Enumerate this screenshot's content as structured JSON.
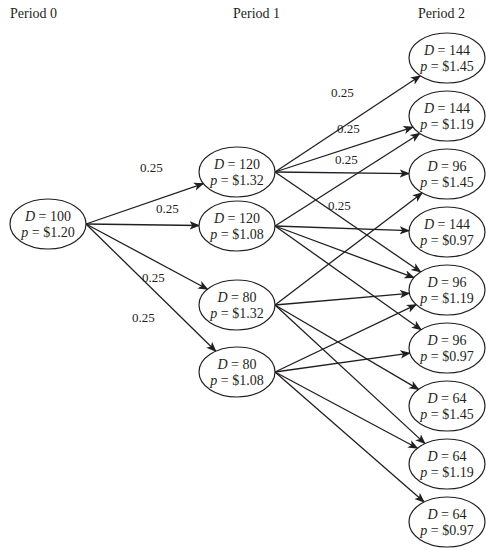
{
  "periods": [
    {
      "label": "Period 0",
      "x": 60
    },
    {
      "label": "Period 1",
      "x": 260
    },
    {
      "label": "Period 2",
      "x": 447
    }
  ],
  "colors": {
    "line": "#231f20",
    "node_fill": "#ffffff",
    "background": "#ffffff"
  },
  "node_size": {
    "rx": 38,
    "ry": 25
  },
  "nodes": [
    {
      "id": "p0",
      "period": 0,
      "D": "100",
      "p": "$1.20",
      "x": 48,
      "y": 224
    },
    {
      "id": "a",
      "period": 1,
      "D": "120",
      "p": "$1.32",
      "x": 237,
      "y": 172
    },
    {
      "id": "b",
      "period": 1,
      "D": "120",
      "p": "$1.08",
      "x": 237,
      "y": 226
    },
    {
      "id": "c",
      "period": 1,
      "D": "80",
      "p": "$1.32",
      "x": 237,
      "y": 305
    },
    {
      "id": "d",
      "period": 1,
      "D": "80",
      "p": "$1.08",
      "x": 237,
      "y": 372
    },
    {
      "id": "n1",
      "period": 2,
      "D": "144",
      "p": "$1.45",
      "x": 447,
      "y": 58
    },
    {
      "id": "n2",
      "period": 2,
      "D": "144",
      "p": "$1.19",
      "x": 447,
      "y": 116
    },
    {
      "id": "n3",
      "period": 2,
      "D": "96",
      "p": "$1.45",
      "x": 447,
      "y": 174
    },
    {
      "id": "n4",
      "period": 2,
      "D": "144",
      "p": "$0.97",
      "x": 447,
      "y": 232
    },
    {
      "id": "n5",
      "period": 2,
      "D": "96",
      "p": "$1.19",
      "x": 447,
      "y": 290
    },
    {
      "id": "n6",
      "period": 2,
      "D": "96",
      "p": "$0.97",
      "x": 447,
      "y": 348
    },
    {
      "id": "n7",
      "period": 2,
      "D": "64",
      "p": "$1.45",
      "x": 447,
      "y": 406
    },
    {
      "id": "n8",
      "period": 2,
      "D": "64",
      "p": "$1.19",
      "x": 447,
      "y": 464
    },
    {
      "id": "n9",
      "period": 2,
      "D": "64",
      "p": "$0.97",
      "x": 447,
      "y": 522
    }
  ],
  "edges": [
    {
      "from": "p0",
      "to": "a"
    },
    {
      "from": "p0",
      "to": "b"
    },
    {
      "from": "p0",
      "to": "c"
    },
    {
      "from": "p0",
      "to": "d"
    },
    {
      "from": "a",
      "to": "n1"
    },
    {
      "from": "a",
      "to": "n2"
    },
    {
      "from": "a",
      "to": "n3"
    },
    {
      "from": "a",
      "to": "n5"
    },
    {
      "from": "b",
      "to": "n2"
    },
    {
      "from": "b",
      "to": "n4"
    },
    {
      "from": "b",
      "to": "n5"
    },
    {
      "from": "b",
      "to": "n6"
    },
    {
      "from": "c",
      "to": "n3"
    },
    {
      "from": "c",
      "to": "n5"
    },
    {
      "from": "c",
      "to": "n7"
    },
    {
      "from": "c",
      "to": "n8"
    },
    {
      "from": "d",
      "to": "n5"
    },
    {
      "from": "d",
      "to": "n6"
    },
    {
      "from": "d",
      "to": "n8"
    },
    {
      "from": "d",
      "to": "n9"
    }
  ],
  "probability_labels": [
    {
      "text": "0.25",
      "x": 140,
      "y": 172
    },
    {
      "text": "0.25",
      "x": 156,
      "y": 213
    },
    {
      "text": "0.25",
      "x": 142,
      "y": 282
    },
    {
      "text": "0.25",
      "x": 132,
      "y": 322
    },
    {
      "text": "0.25",
      "x": 331,
      "y": 97
    },
    {
      "text": "0.25",
      "x": 337,
      "y": 133
    },
    {
      "text": "0.25",
      "x": 335,
      "y": 164
    },
    {
      "text": "0.25",
      "x": 328,
      "y": 210
    }
  ]
}
